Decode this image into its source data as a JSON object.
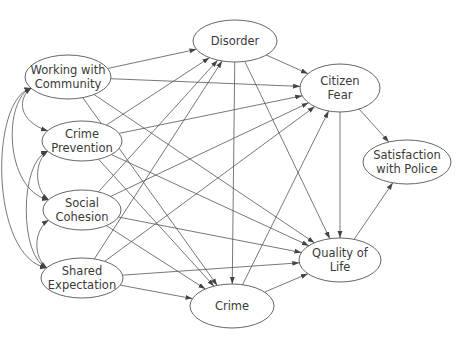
{
  "diagram": {
    "type": "path-model",
    "colors": {
      "stroke": "#555555",
      "text": "#3a3a3a",
      "background": "#ffffff"
    },
    "nodes": [
      {
        "id": "wwc",
        "lines": [
          "Working with",
          "Community"
        ],
        "cx": 68,
        "cy": 77,
        "rx": 43,
        "ry": 22
      },
      {
        "id": "cp",
        "lines": [
          "Crime",
          "Prevention"
        ],
        "cx": 82,
        "cy": 141,
        "rx": 40,
        "ry": 20
      },
      {
        "id": "sc",
        "lines": [
          "Social",
          "Cohesion"
        ],
        "cx": 82,
        "cy": 210,
        "rx": 39,
        "ry": 20
      },
      {
        "id": "se",
        "lines": [
          "Shared",
          "Expectation"
        ],
        "cx": 82,
        "cy": 278,
        "rx": 41,
        "ry": 20
      },
      {
        "id": "dis",
        "lines": [
          "Disorder"
        ],
        "cx": 235,
        "cy": 41,
        "rx": 42,
        "ry": 21
      },
      {
        "id": "crm",
        "lines": [
          "Crime"
        ],
        "cx": 232,
        "cy": 306,
        "rx": 42,
        "ry": 22
      },
      {
        "id": "cf",
        "lines": [
          "Citizen",
          "Fear"
        ],
        "cx": 340,
        "cy": 88,
        "rx": 40,
        "ry": 24
      },
      {
        "id": "swp",
        "lines": [
          "Satisfaction",
          "with Police"
        ],
        "cx": 407,
        "cy": 162,
        "rx": 44,
        "ry": 22
      },
      {
        "id": "qol",
        "lines": [
          "Quality of",
          "Life"
        ],
        "cx": 340,
        "cy": 260,
        "rx": 41,
        "ry": 22
      }
    ],
    "edges": [
      {
        "from": "wwc",
        "to": "dis"
      },
      {
        "from": "wwc",
        "to": "cf"
      },
      {
        "from": "wwc",
        "to": "qol"
      },
      {
        "from": "wwc",
        "to": "crm"
      },
      {
        "from": "cp",
        "to": "dis"
      },
      {
        "from": "cp",
        "to": "cf"
      },
      {
        "from": "cp",
        "to": "qol"
      },
      {
        "from": "cp",
        "to": "crm"
      },
      {
        "from": "sc",
        "to": "dis"
      },
      {
        "from": "sc",
        "to": "cf"
      },
      {
        "from": "sc",
        "to": "qol"
      },
      {
        "from": "sc",
        "to": "crm"
      },
      {
        "from": "se",
        "to": "dis"
      },
      {
        "from": "se",
        "to": "cf"
      },
      {
        "from": "se",
        "to": "qol"
      },
      {
        "from": "se",
        "to": "crm"
      },
      {
        "from": "dis",
        "to": "cf"
      },
      {
        "from": "dis",
        "to": "qol"
      },
      {
        "from": "dis",
        "to": "crm"
      },
      {
        "from": "crm",
        "to": "cf"
      },
      {
        "from": "crm",
        "to": "qol"
      },
      {
        "from": "cf",
        "to": "qol"
      },
      {
        "from": "cf",
        "to": "swp"
      },
      {
        "from": "qol",
        "to": "swp"
      }
    ],
    "correlations": [
      {
        "a": "wwc",
        "b": "cp",
        "bulge": 14
      },
      {
        "a": "cp",
        "b": "sc",
        "bulge": 14
      },
      {
        "a": "sc",
        "b": "se",
        "bulge": 14
      },
      {
        "a": "wwc",
        "b": "sc",
        "bulge": 28
      },
      {
        "a": "cp",
        "b": "se",
        "bulge": 28
      },
      {
        "a": "wwc",
        "b": "se",
        "bulge": 42
      }
    ]
  }
}
